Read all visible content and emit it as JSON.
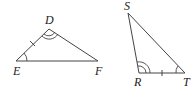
{
  "diagram": {
    "type": "congruent-triangles",
    "triangles": [
      {
        "name": "DEF",
        "vertices": {
          "D": {
            "label": "D",
            "x": 49,
            "y": 29
          },
          "E": {
            "label": "E",
            "x": 16,
            "y": 61
          },
          "F": {
            "label": "F",
            "x": 98,
            "y": 61
          }
        },
        "marks": {
          "side_tick": "ED",
          "single_arc": "E",
          "double_arc": "D"
        }
      },
      {
        "name": "SRT",
        "vertices": {
          "S": {
            "label": "S",
            "x": 128,
            "y": 13
          },
          "R": {
            "label": "R",
            "x": 139,
            "y": 73
          },
          "T": {
            "label": "T",
            "x": 185,
            "y": 73
          }
        },
        "marks": {
          "side_tick": "RT",
          "single_arc": "T",
          "double_arc": "R"
        }
      }
    ],
    "colors": {
      "stroke": "#444444",
      "label": "#222222"
    }
  }
}
